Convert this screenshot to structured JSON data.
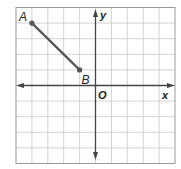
{
  "diagram": {
    "type": "coordinate-plane",
    "grid": {
      "cells_x": 10,
      "cells_y": 10,
      "x_range": [
        -5,
        5
      ],
      "y_range": [
        -5,
        5
      ]
    },
    "axes": {
      "x_label": "x",
      "y_label": "y",
      "origin_label": "O"
    },
    "segment": {
      "points": [
        {
          "label": "A",
          "x": -4,
          "y": 4
        },
        {
          "label": "B",
          "x": -1,
          "y": 1
        }
      ]
    },
    "colors": {
      "grid": "#c8c8c8",
      "axis": "#444444",
      "segment": "#555555",
      "border": "#999999"
    }
  }
}
